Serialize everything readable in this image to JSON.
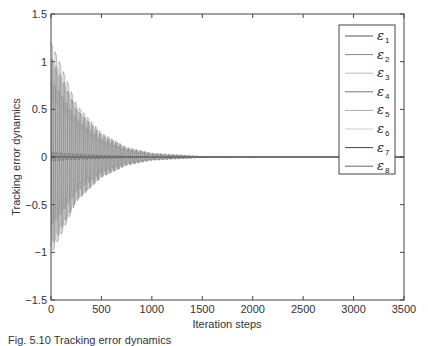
{
  "chart_data": {
    "type": "line",
    "title": "",
    "xlabel": "Iteration steps",
    "ylabel": "Tracking error dynamics",
    "xlim": [
      0,
      3500
    ],
    "ylim": [
      -1.5,
      1.5
    ],
    "xticks": [
      0,
      500,
      1000,
      1500,
      2000,
      2500,
      3000,
      3500
    ],
    "yticks": [
      -1.5,
      -1,
      -0.5,
      0,
      0.5,
      1,
      1.5
    ],
    "xtick_labels": [
      "0",
      "500",
      "1000",
      "1500",
      "2000",
      "2500",
      "3000",
      "3500"
    ],
    "ytick_labels": [
      "−1.5",
      "−1",
      "−0.5",
      "0",
      "0.5",
      "1",
      "1.5"
    ],
    "grid": false,
    "legend_position": "upper right",
    "series": [
      {
        "name": "ε1",
        "label": "ε",
        "sub": "1",
        "color": "#555555",
        "envelope": {
          "x": [
            0,
            100,
            250,
            500,
            750,
            1000,
            1500,
            3500
          ],
          "y": [
            1.2,
            0.95,
            0.55,
            0.25,
            0.1,
            0.04,
            0.005,
            0
          ]
        }
      },
      {
        "name": "ε2",
        "label": "ε",
        "sub": "2",
        "color": "#888888",
        "envelope": {
          "x": [
            0,
            100,
            250,
            500,
            750,
            1000,
            1500,
            3500
          ],
          "y": [
            1.0,
            0.8,
            0.5,
            0.22,
            0.09,
            0.03,
            0.004,
            0
          ]
        }
      },
      {
        "name": "ε3",
        "label": "ε",
        "sub": "3",
        "color": "#bbbbbb",
        "envelope": {
          "x": [
            0,
            100,
            250,
            500,
            750,
            1000,
            1500,
            3500
          ],
          "y": [
            0.9,
            0.7,
            0.45,
            0.2,
            0.08,
            0.03,
            0.004,
            0
          ]
        }
      },
      {
        "name": "ε4",
        "label": "ε",
        "sub": "4",
        "color": "#777777",
        "envelope": {
          "x": [
            0,
            100,
            250,
            500,
            750,
            1000,
            1500,
            3500
          ],
          "y": [
            0.8,
            0.65,
            0.4,
            0.18,
            0.07,
            0.025,
            0.003,
            0
          ]
        }
      },
      {
        "name": "ε5",
        "label": "ε",
        "sub": "5",
        "color": "#aaaaaa",
        "envelope": {
          "x": [
            0,
            100,
            250,
            500,
            750,
            1000,
            1500,
            3500
          ],
          "y": [
            0.7,
            0.55,
            0.35,
            0.15,
            0.06,
            0.02,
            0.003,
            0
          ]
        }
      },
      {
        "name": "ε6",
        "label": "ε",
        "sub": "6",
        "color": "#cccccc",
        "envelope": {
          "x": [
            0,
            100,
            250,
            500,
            750,
            1000,
            1500,
            3500
          ],
          "y": [
            0.6,
            0.5,
            0.3,
            0.13,
            0.05,
            0.02,
            0.002,
            0
          ]
        }
      },
      {
        "name": "ε7",
        "label": "ε",
        "sub": "7",
        "color": "#444444",
        "envelope": {
          "x": [
            0,
            100,
            250,
            500,
            750,
            1000,
            1500,
            3500
          ],
          "y": [
            0.05,
            0.04,
            0.03,
            0.02,
            0.01,
            0.005,
            0.001,
            0
          ]
        }
      },
      {
        "name": "ε8",
        "label": "ε",
        "sub": "8",
        "color": "#666666",
        "envelope": {
          "x": [
            0,
            100,
            250,
            500,
            750,
            1000,
            1500,
            3500
          ],
          "y": [
            1.05,
            0.85,
            0.5,
            0.23,
            0.09,
            0.035,
            0.004,
            0
          ]
        }
      }
    ]
  },
  "caption": "Fig. 5.10 Tracking error dynamics"
}
